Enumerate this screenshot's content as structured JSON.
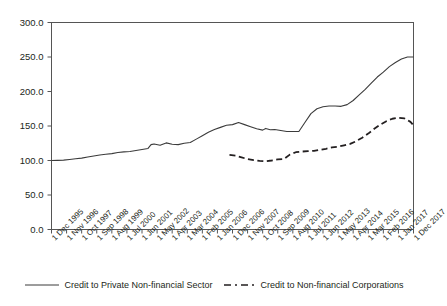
{
  "chart_data": {
    "type": "line",
    "title": "",
    "xlabel": "",
    "ylabel": "",
    "ylim": [
      0,
      300
    ],
    "ytick_step": 50,
    "grid": false,
    "legend_position": "bottom",
    "yticks": [
      "0.0",
      "50.0",
      "100.0",
      "150.0",
      "200.0",
      "250.0",
      "300.0"
    ],
    "categories": [
      "1 Dec 1995",
      "1 Nov 1996",
      "1 Oct 1997",
      "1 Sep 1998",
      "1 Aug 1999",
      "1 Jul 2000",
      "1 Jun 2001",
      "1 May 2002",
      "1 Apr 2003",
      "1 Mar 2004",
      "1 Feb 2005",
      "1 Jan 2006",
      "1 Dec 2006",
      "1 Nov 2007",
      "1 Oct 2008",
      "1 Sep 2009",
      "1 Aug 2010",
      "1 Jul 2011",
      "1 Jun 2012",
      "1 May 2013",
      "1 Apr 2014",
      "1 Mar 2015",
      "1 Feb 2016",
      "1 Jan 2017",
      "1 Dec 2017"
    ],
    "series": [
      {
        "name": "Credit to Private Non-financial Sector",
        "style": "solid",
        "color": "#3b3b3b",
        "x": [
          0.0,
          0.4,
          0.8,
          1.2,
          1.6,
          2.0,
          2.4,
          2.8,
          3.2,
          3.6,
          4.0,
          4.4,
          4.8,
          5.2,
          5.6,
          6.0,
          6.4,
          6.6,
          6.8,
          7.2,
          7.6,
          8.0,
          8.4,
          8.8,
          9.2,
          9.6,
          10.0,
          10.4,
          10.8,
          11.2,
          11.6,
          12.0,
          12.4,
          12.8,
          13.2,
          13.6,
          14.0,
          14.2,
          14.5,
          14.8,
          15.2,
          15.6,
          16.0,
          16.4,
          16.8,
          17.2,
          17.6,
          18.0,
          18.4,
          18.8,
          19.2,
          19.6,
          20.0,
          20.4,
          20.8,
          21.2,
          21.6,
          22.0,
          22.4,
          22.8,
          23.2,
          23.6,
          24.0
        ],
        "values": [
          100.0,
          100.2,
          100.6,
          101.5,
          102.5,
          103.5,
          105.0,
          106.5,
          108.0,
          109.0,
          110.0,
          111.5,
          112.5,
          113.0,
          114.5,
          116.0,
          117.5,
          123.0,
          124.0,
          122.0,
          125.5,
          123.5,
          123.0,
          125.0,
          126.0,
          131.0,
          136.0,
          141.0,
          145.0,
          148.0,
          151.0,
          152.0,
          155.0,
          152.0,
          149.0,
          146.0,
          144.0,
          146.5,
          144.5,
          145.0,
          143.5,
          142.0,
          142.0,
          142.0,
          155.0,
          168.0,
          175.0,
          178.0,
          179.0,
          179.0,
          178.5,
          181.0,
          187.0,
          195.0,
          203.0,
          212.0,
          221.0,
          228.0,
          236.0,
          242.0,
          247.0,
          250.0,
          250.0
        ]
      },
      {
        "name": "Credit to Non-financial Corporations",
        "style": "dashed",
        "color": "#231f20",
        "x": [
          11.8,
          12.2,
          12.6,
          13.0,
          13.4,
          13.8,
          14.2,
          14.6,
          15.0,
          15.4,
          15.8,
          16.2,
          16.6,
          17.0,
          17.4,
          17.8,
          18.2,
          18.6,
          19.0,
          19.4,
          19.8,
          20.2,
          20.6,
          21.0,
          21.4,
          21.8,
          22.2,
          22.6,
          23.0,
          23.4,
          23.8,
          24.0
        ],
        "values": [
          108.0,
          107.0,
          104.5,
          102.0,
          100.5,
          99.5,
          99.0,
          100.0,
          101.5,
          102.0,
          108.5,
          112.0,
          113.0,
          113.5,
          114.0,
          115.5,
          117.0,
          119.0,
          120.0,
          122.0,
          124.0,
          128.0,
          133.0,
          139.0,
          146.0,
          152.0,
          157.0,
          160.5,
          162.0,
          161.0,
          156.0,
          151.0
        ]
      }
    ]
  }
}
